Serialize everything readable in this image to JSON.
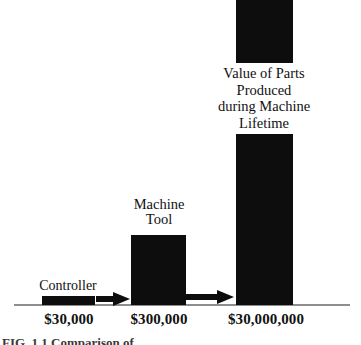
{
  "figure": {
    "caption_partial": "FIG. 1.1  Comparison of",
    "background_color": "#ffffff",
    "bar_color": "#0d0d0d",
    "axis_color": "#8e8e8e",
    "text_color": "#111111"
  },
  "chart_data": {
    "type": "bar",
    "title": "",
    "subtitle": "",
    "xlabel": "",
    "ylabel": "",
    "grid": false,
    "legend": "none",
    "scale": "logarithmic-illustrative",
    "categories": [
      "Controller",
      "Machine Tool",
      "Value of Parts Produced during Machine Lifetime"
    ],
    "value_labels": [
      "$30,000",
      "$300,000",
      "$30,000,000"
    ],
    "values": [
      30000,
      300000,
      30000000
    ],
    "annotations": [
      "arrow-1",
      "arrow-2"
    ]
  },
  "bars": [
    {
      "name": "Controller",
      "label_lines": "Controller",
      "money": "$30,000",
      "value": 30000
    },
    {
      "name": "Machine Tool",
      "label_lines": "Machine\nTool",
      "money": "$300,000",
      "value": 300000
    },
    {
      "name": "Value of Parts Produced during Machine Lifetime",
      "label_lines": "Value of Parts\nProduced\nduring Machine\nLifetime",
      "money": "$30,000,000",
      "value": 30000000
    }
  ],
  "arrows": {
    "arrow_1_name": "controller-to-machine-tool-arrow",
    "arrow_2_name": "machine-tool-to-value-arrow"
  }
}
